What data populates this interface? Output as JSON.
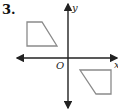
{
  "problem": {
    "number_label": "3."
  },
  "axes": {
    "x_label": "x",
    "y_label": "y",
    "origin_label": "O",
    "origin_px": [
      68,
      58
    ],
    "x_range_px": [
      16,
      118
    ],
    "y_range_px": [
      3,
      109
    ],
    "color": "#222222"
  },
  "shapes": [
    {
      "name": "quadrilateral-upper-left",
      "quadrant": "II",
      "points_px": [
        [
          27,
          22
        ],
        [
          42,
          22
        ],
        [
          57,
          46
        ],
        [
          27,
          46
        ]
      ],
      "stroke": "#8a8a8a"
    },
    {
      "name": "quadrilateral-lower-right",
      "quadrant": "IV",
      "points_px": [
        [
          80,
          70
        ],
        [
          111,
          70
        ],
        [
          111,
          94
        ],
        [
          96,
          94
        ]
      ],
      "stroke": "#8a8a8a"
    }
  ]
}
